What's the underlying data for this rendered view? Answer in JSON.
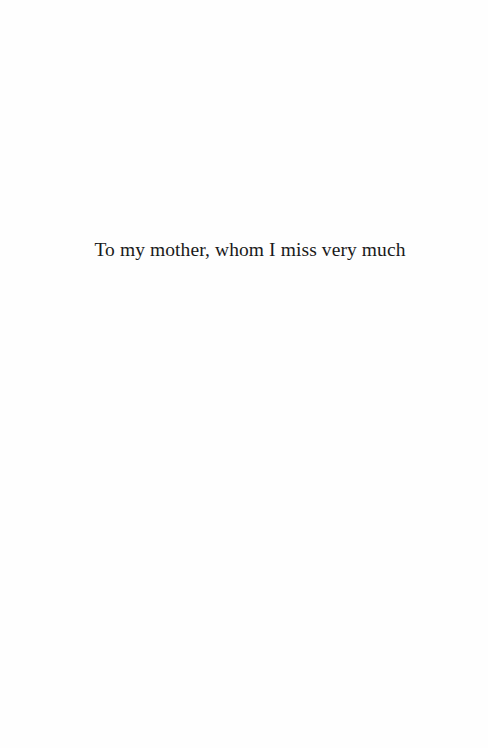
{
  "page": {
    "dedication": "To my mother, whom I miss very much"
  }
}
